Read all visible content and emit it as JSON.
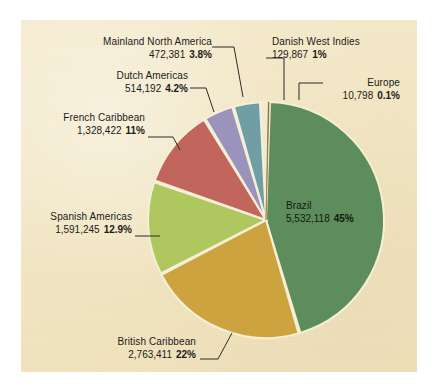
{
  "chart_data": {
    "type": "pie",
    "title": "",
    "subtitle": "",
    "xlabel": "",
    "ylabel": "",
    "legend_position": "none",
    "grid": false,
    "total_label": "",
    "categories": [
      "Brazil",
      "British Caribbean",
      "Spanish Americas",
      "French Caribbean",
      "Dutch Americas",
      "Mainland North America",
      "Danish West Indies",
      "Europe"
    ],
    "values": [
      5532118,
      2763411,
      1591245,
      1328422,
      514192,
      472381,
      129867,
      10798
    ],
    "percents": [
      45,
      22,
      12.9,
      11,
      4.2,
      3.8,
      1,
      0.1
    ],
    "value_labels": [
      "5,532,118",
      "2,763,411",
      "1,591,245",
      "1,328,422",
      "514,192",
      "472,381",
      "129,867",
      "10,798"
    ],
    "percent_labels": [
      "45%",
      "22%",
      "12.9%",
      "11%",
      "4.2%",
      "3.8%",
      "1%",
      "0.1%"
    ],
    "colors": [
      "#5d8d5c",
      "#cda33f",
      "#aec85f",
      "#c2655d",
      "#9a93bc",
      "#6f9fa4",
      "#f0ead2",
      "#8a6a2a"
    ],
    "slices": [
      {
        "name": "Brazil",
        "value_label": "5,532,118",
        "percent_label": "45%",
        "percent": 45,
        "color": "#5d8d5c",
        "start_deg": 1.5,
        "sweep_deg": 162.0
      },
      {
        "name": "British Caribbean",
        "value_label": "2,763,411",
        "percent_label": "22%",
        "percent": 22,
        "color": "#cda33f",
        "start_deg": 163.5,
        "sweep_deg": 79.2
      },
      {
        "name": "Spanish Americas",
        "value_label": "1,591,245",
        "percent_label": "12.9%",
        "percent": 12.9,
        "color": "#aec85f",
        "start_deg": 242.7,
        "sweep_deg": 46.4
      },
      {
        "name": "French Caribbean",
        "value_label": "1,328,422",
        "percent_label": "11%",
        "percent": 11,
        "color": "#c2655d",
        "start_deg": 289.1,
        "sweep_deg": 39.6
      },
      {
        "name": "Dutch Americas",
        "value_label": "514,192",
        "percent_label": "4.2%",
        "percent": 4.2,
        "color": "#9a93bc",
        "start_deg": 328.7,
        "sweep_deg": 15.1
      },
      {
        "name": "Mainland North America",
        "value_label": "472,381",
        "percent_label": "3.8%",
        "percent": 3.8,
        "color": "#6f9fa4",
        "start_deg": 343.8,
        "sweep_deg": 13.7
      },
      {
        "name": "Danish West Indies",
        "value_label": "129,867",
        "percent_label": "1%",
        "percent": 1,
        "color": "#f0ead2",
        "start_deg": 357.5,
        "sweep_deg": 3.6
      },
      {
        "name": "Europe",
        "value_label": "10,798",
        "percent_label": "0.1%",
        "percent": 0.1,
        "color": "#8a6a2a",
        "start_deg": 361.1,
        "sweep_deg": 0.4
      }
    ]
  },
  "labels": {
    "mainland_north_america": {
      "name": "Mainland North America",
      "value": "472,381",
      "percent": "3.8%"
    },
    "dutch_americas": {
      "name": "Dutch Americas",
      "value": "514,192",
      "percent": "4.2%"
    },
    "french_caribbean": {
      "name": "French Caribbean",
      "value": "1,328,422",
      "percent": "11%"
    },
    "spanish_americas": {
      "name": "Spanish Americas",
      "value": "1,591,245",
      "percent": "12.9%"
    },
    "british_caribbean": {
      "name": "British Caribbean",
      "value": "2,763,411",
      "percent": "22%"
    },
    "danish_west_indies": {
      "name": "Danish West Indies",
      "value": "129,867",
      "percent": "1%"
    },
    "europe": {
      "name": "Europe",
      "value": "10,798",
      "percent": "0.1%"
    },
    "brazil": {
      "name": "Brazil",
      "value": "5,532,118",
      "percent": "45%"
    }
  },
  "style": {
    "panel_background": "#f4e9c8",
    "page_background": "#ffffff",
    "text_color": "#1b1b18",
    "slice_separator": "#f6efd8"
  }
}
